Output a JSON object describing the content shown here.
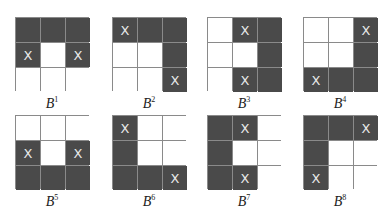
{
  "figure": {
    "panels": [
      {
        "name": "B",
        "sup": "1",
        "cells": [
          "D",
          "D",
          "D",
          "DX",
          "W",
          "DX",
          "W",
          "W",
          "W"
        ]
      },
      {
        "name": "B",
        "sup": "2",
        "cells": [
          "DX",
          "D",
          "D",
          "W",
          "W",
          "D",
          "W",
          "W",
          "DX"
        ]
      },
      {
        "name": "B",
        "sup": "3",
        "cells": [
          "W",
          "DX",
          "D",
          "W",
          "W",
          "D",
          "W",
          "DX",
          "D"
        ]
      },
      {
        "name": "B",
        "sup": "4",
        "cells": [
          "W",
          "W",
          "DX",
          "W",
          "W",
          "D",
          "DX",
          "D",
          "D"
        ]
      },
      {
        "name": "B",
        "sup": "5",
        "cells": [
          "W",
          "W",
          "W",
          "DX",
          "W",
          "DX",
          "D",
          "D",
          "D"
        ]
      },
      {
        "name": "B",
        "sup": "6",
        "cells": [
          "DX",
          "W",
          "W",
          "D",
          "W",
          "W",
          "D",
          "D",
          "DX"
        ]
      },
      {
        "name": "B",
        "sup": "7",
        "cells": [
          "D",
          "DX",
          "W",
          "D",
          "W",
          "W",
          "D",
          "DX",
          "W"
        ]
      },
      {
        "name": "B",
        "sup": "8",
        "cells": [
          "D",
          "D",
          "DX",
          "D",
          "W",
          "W",
          "DX",
          "W",
          "W"
        ]
      }
    ],
    "mark_glyph": "X",
    "colors": {
      "dark": "#4a4a4a",
      "light": "#ffffff",
      "grid": "#8a8a8a",
      "mark": "#e8e8e8"
    }
  }
}
